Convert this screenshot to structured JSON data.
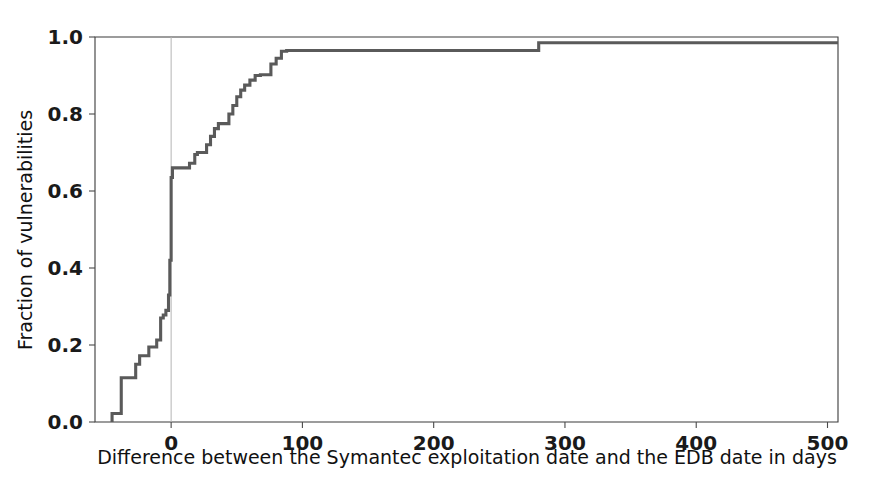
{
  "figure": {
    "width": 874,
    "height": 483,
    "background": "#ffffff",
    "line_color": "#5a5a5a",
    "axis_color": "#3b3b3b",
    "vline_color": "#b4b4b4"
  },
  "chart_data": {
    "type": "line",
    "title": "",
    "xlabel": "Difference between the Symantec exploitation date and the EDB date in days",
    "ylabel": "Fraction of vulnerabilities",
    "xlim": [
      -58,
      508
    ],
    "ylim": [
      0.0,
      1.0
    ],
    "grid": false,
    "legend": null,
    "xticks": [
      0,
      100,
      200,
      300,
      400,
      500
    ],
    "xtick_labels": [
      "0",
      "100",
      "200",
      "300",
      "400",
      "500"
    ],
    "yticks": [
      0.0,
      0.2,
      0.4,
      0.6,
      0.8,
      1.0
    ],
    "ytick_labels": [
      "0.0",
      "0.2",
      "0.4",
      "0.6",
      "0.8",
      "1.0"
    ],
    "annotations": [
      {
        "type": "vline",
        "x": 0,
        "label": "zero-difference reference line"
      }
    ],
    "series": [
      {
        "name": "Empirical CDF of date difference",
        "step": "post",
        "x": [
          -45,
          -45,
          -41,
          -38,
          -34,
          -30,
          -27,
          -24,
          -20,
          -17,
          -14,
          -11,
          -8,
          -6,
          -4,
          -2,
          -1,
          0,
          1,
          3,
          6,
          10,
          14,
          18,
          20,
          24,
          27,
          30,
          33,
          36,
          40,
          44,
          47,
          50,
          53,
          56,
          60,
          64,
          68,
          72,
          76,
          80,
          84,
          88,
          120,
          180,
          240,
          280,
          340,
          420,
          500
        ],
        "y": [
          0.0,
          0.022,
          0.022,
          0.115,
          0.115,
          0.115,
          0.15,
          0.172,
          0.172,
          0.195,
          0.195,
          0.213,
          0.27,
          0.278,
          0.29,
          0.33,
          0.42,
          0.635,
          0.66,
          0.66,
          0.66,
          0.66,
          0.672,
          0.695,
          0.7,
          0.7,
          0.72,
          0.742,
          0.762,
          0.775,
          0.775,
          0.8,
          0.822,
          0.845,
          0.862,
          0.875,
          0.888,
          0.9,
          0.902,
          0.902,
          0.93,
          0.945,
          0.963,
          0.965,
          0.965,
          0.965,
          0.965,
          0.985,
          0.985,
          0.985,
          0.985
        ]
      }
    ]
  },
  "axes": {
    "x_axis_name": "x-axis",
    "y_axis_name": "y-axis"
  }
}
